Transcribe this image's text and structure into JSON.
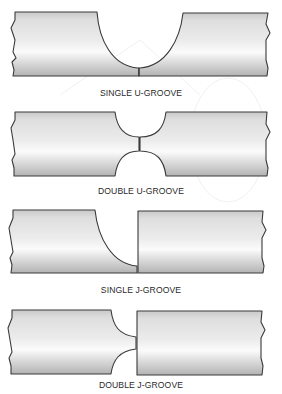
{
  "figure": {
    "colors": {
      "outline": "#3a3a3a",
      "metal_light": "#f4f4f4",
      "metal_mid": "#dcdcdc",
      "metal_dark": "#b8b8b8",
      "label_text": "#2a2a2a",
      "background": "#ffffff"
    },
    "joints": [
      {
        "id": "single-u-groove",
        "label": "SINGLE U-GROOVE"
      },
      {
        "id": "double-u-groove",
        "label": "DOUBLE U-GROOVE"
      },
      {
        "id": "single-j-groove",
        "label": "SINGLE J-GROOVE"
      },
      {
        "id": "double-j-groove",
        "label": "DOUBLE J-GROOVE"
      }
    ]
  }
}
